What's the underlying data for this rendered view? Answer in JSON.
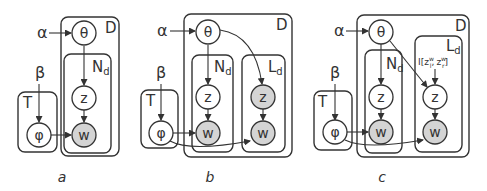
{
  "figure": {
    "panels": [
      {
        "caption": "a",
        "hyperparams": {
          "alpha": "α",
          "beta": "β"
        },
        "plates": {
          "D": "D",
          "N": "N",
          "N_sub": "d",
          "T": "T"
        },
        "nodes": {
          "theta": "θ",
          "z": "z",
          "w": "w",
          "phi": "φ"
        }
      },
      {
        "caption": "b",
        "hyperparams": {
          "alpha": "α",
          "beta": "β"
        },
        "plates": {
          "D": "D",
          "N": "N",
          "N_sub": "d",
          "L": "L",
          "L_sub": "d",
          "T": "T"
        },
        "nodes": {
          "theta": "θ",
          "z": "z",
          "w": "w",
          "z2": "z",
          "w2": "w",
          "phi": "φ"
        }
      },
      {
        "caption": "c",
        "hyperparams": {
          "alpha": "α",
          "beta": "β"
        },
        "plates": {
          "D": "D",
          "N": "N",
          "N_sub": "d",
          "L": "L",
          "L_sub": "d",
          "T": "T"
        },
        "nodes": {
          "theta": "θ",
          "z": "z",
          "w": "w",
          "z2": "z",
          "w2": "w",
          "phi": "φ"
        },
        "indicator": {
          "prefix": "I[",
          "z1": "z",
          "z1_sup": "w",
          "z1_sub": "l",
          "sep": ",",
          "z2": "z",
          "z2_sup": "w",
          "z2_sub": "r",
          "suffix": "]"
        }
      }
    ],
    "colors": {
      "observed_fill": "#d4d4d4",
      "latent_fill": "#ffffff",
      "stroke": "#333333"
    }
  }
}
